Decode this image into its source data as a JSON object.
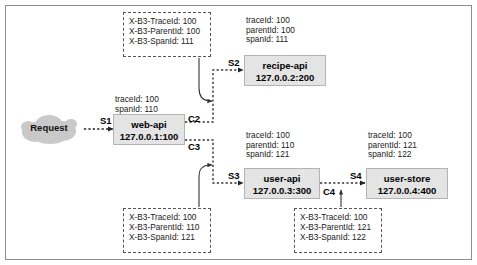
{
  "diagram": {
    "request_label": "Request",
    "nodes": [
      {
        "id": "web-api",
        "name": "web-api",
        "address": "127.0.0.1:100"
      },
      {
        "id": "recipe-api",
        "name": "recipe-api",
        "address": "127.0.0.2:200"
      },
      {
        "id": "user-api",
        "name": "user-api",
        "address": "127.0.0.3:300"
      },
      {
        "id": "user-store",
        "name": "user-store",
        "address": "127.0.0.4:400"
      }
    ],
    "span_tags": [
      {
        "id": "s1",
        "label": "S1"
      },
      {
        "id": "c2",
        "label": "C2"
      },
      {
        "id": "c3",
        "label": "C3"
      },
      {
        "id": "s2",
        "label": "S2"
      },
      {
        "id": "s3",
        "label": "S3"
      },
      {
        "id": "c4",
        "label": "C4"
      },
      {
        "id": "s4",
        "label": "S4"
      }
    ],
    "span_contexts": [
      {
        "id": "web-api-ctx",
        "lines": "traceId: 100\nspanId: 110"
      },
      {
        "id": "recipe-api-ctx",
        "lines": "traceId: 100\nparentId: 100\nspanId: 111"
      },
      {
        "id": "user-api-ctx",
        "lines": "traceId: 100\nparentId: 110\nspanId: 121"
      },
      {
        "id": "user-store-ctx",
        "lines": "traceId: 100\nparentId: 121\nspanId: 122"
      }
    ],
    "http_headers": [
      {
        "id": "headers-c2",
        "lines": "X-B3-TraceId: 100\nX-B3-ParentId: 100\nX-B3-SpanId: 111"
      },
      {
        "id": "headers-c3",
        "lines": "X-B3-TraceId: 100\nX-B3-ParentId: 110\nX-B3-SpanId: 121"
      },
      {
        "id": "headers-c4",
        "lines": "X-B3-TraceId: 100\nX-B3-ParentId: 121\nX-B3-SpanId: 122"
      }
    ],
    "colors": {
      "node_fill": "#e4e4e4",
      "node_border": "#b4b4b4",
      "frame_border": "#8e8e8e",
      "wire": "#333333",
      "text": "#1a1a1a"
    }
  }
}
